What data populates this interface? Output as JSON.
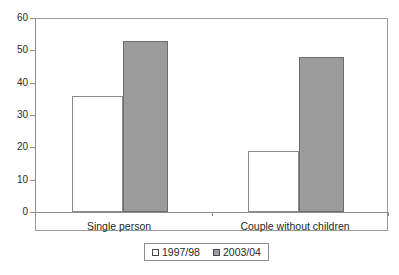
{
  "chart_data": {
    "type": "bar",
    "title": "",
    "subtitle": "",
    "xlabel": "",
    "ylabel": "",
    "categories": [
      "Single person",
      "Couple without children"
    ],
    "series": [
      {
        "name": "1997/98",
        "values": [
          36,
          19
        ],
        "swatch": "hollow-square",
        "color": "#ffffff"
      },
      {
        "name": "2003/04",
        "values": [
          53,
          48
        ],
        "swatch": "filled-square",
        "color": "#9c9c9c"
      }
    ],
    "ylim": [
      0,
      60
    ],
    "yticks": [
      0,
      10,
      20,
      30,
      40,
      50,
      60
    ],
    "ytick_labels": [
      "0",
      "10",
      "20",
      "30",
      "40",
      "50",
      "60"
    ],
    "grid": false,
    "legend_position": "bottom-center",
    "frame": true,
    "bar_layout": "adjacent-grouped"
  },
  "legend": {
    "entries": [
      {
        "label": "1997/98"
      },
      {
        "label": "2003/04"
      }
    ]
  },
  "axes": {
    "y_tick_labels": [
      "60",
      "50",
      "40",
      "30",
      "20",
      "10",
      "0"
    ],
    "x_category_labels": [
      "Single person",
      "Couple without children"
    ]
  }
}
